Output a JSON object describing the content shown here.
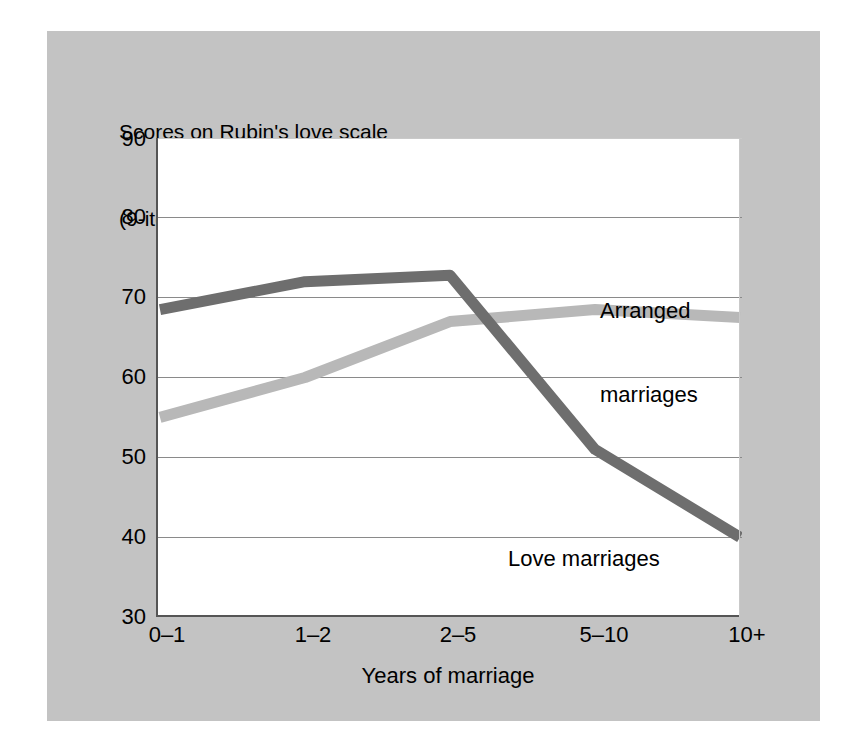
{
  "figure": {
    "background_color": "#ffffff",
    "mat_color": "#c3c3c3",
    "panel_color": "#ffffff"
  },
  "chart_data": {
    "type": "line",
    "title": "Scores on Rubin's love scale",
    "subtitle": "(9-item version, possible range 9 to 91)",
    "title_lines": [
      "Scores on Rubin's love scale",
      "(9-item version, possible range 9 to 91)"
    ],
    "xlabel": "Years of marriage",
    "ylabel": "",
    "categories": [
      "0–1",
      "1–2",
      "2–5",
      "5–10",
      "10+"
    ],
    "ylim": [
      30,
      90
    ],
    "yticks": [
      30,
      40,
      50,
      60,
      70,
      80,
      90
    ],
    "ytick_labels": [
      "30",
      "40",
      "50",
      "60",
      "70",
      "80",
      "90"
    ],
    "grid": "horizontal",
    "grid_color": "#808080",
    "legend": "inline-annotations",
    "series": [
      {
        "name": "Love marriages",
        "color": "#6e6e6e",
        "line_width": 9,
        "values": [
          68.5,
          72.0,
          72.8,
          51.0,
          40.0
        ],
        "annotation": {
          "text": "Love marriages",
          "lines": [
            "Love marriages"
          ]
        }
      },
      {
        "name": "Arranged marriages",
        "color": "#b8b8b8",
        "line_width": 9,
        "values": [
          55.0,
          60.0,
          67.0,
          68.5,
          67.5
        ],
        "annotation": {
          "text": "Arranged marriages",
          "lines": [
            "Arranged",
            "marriages"
          ]
        }
      }
    ],
    "annotations": [
      {
        "id": "arranged",
        "line1": "Arranged",
        "line2": "marriages"
      },
      {
        "id": "love",
        "line1": "Love marriages",
        "line2": ""
      }
    ]
  }
}
